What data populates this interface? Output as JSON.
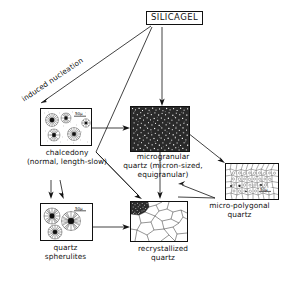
{
  "diagram": {
    "title_node": {
      "label": "SILICAGEL",
      "name": "silicagel-box"
    },
    "edge_labels": [
      {
        "label": "induced nucleation",
        "name": "induced-nucleation-label"
      }
    ],
    "nodes": [
      {
        "id": "chalcedony",
        "caption_lines": [
          "chalcedony",
          "(normal, length-slow)"
        ],
        "scale": "50µ",
        "texture": "spherulitic-fibrous"
      },
      {
        "id": "microgranular-quartz",
        "caption_lines": [
          "microgranular",
          "quartz (micron-sized,",
          "equigranular)"
        ],
        "scale": "",
        "texture": "dense-speckle"
      },
      {
        "id": "micro-polygonal-quartz",
        "caption_lines": [
          "micro-polygonal",
          "quartz"
        ],
        "scale": "50µ",
        "texture": "fine-polygonal-mosaic"
      },
      {
        "id": "quartz-spherulites",
        "caption_lines": [
          "quartz",
          "spherulites"
        ],
        "scale": "50µ",
        "texture": "radial-spherulites"
      },
      {
        "id": "recrystallized-quartz",
        "caption_lines": [
          "recrystallized",
          "quartz"
        ],
        "scale": "",
        "texture": "coarse-polygonal-mosaic"
      }
    ],
    "edges": [
      {
        "from": "SILICAGEL",
        "to": "chalcedony",
        "label": "induced nucleation"
      },
      {
        "from": "SILICAGEL",
        "to": "microgranular quartz",
        "label": ""
      },
      {
        "from": "SILICAGEL",
        "to": "recrystallized quartz",
        "label": ""
      },
      {
        "from": "chalcedony",
        "to": "microgranular quartz",
        "label": ""
      },
      {
        "from": "chalcedony",
        "to": "quartz spherulites",
        "label": ""
      },
      {
        "from": "chalcedony",
        "to": "recrystallized quartz",
        "label": ""
      },
      {
        "from": "microgranular quartz",
        "to": "micro-polygonal quartz",
        "label": ""
      },
      {
        "from": "microgranular quartz",
        "to": "recrystallized quartz",
        "label": ""
      },
      {
        "from": "micro-polygonal quartz",
        "to": "recrystallized quartz",
        "label": ""
      },
      {
        "from": "quartz spherulites",
        "to": "recrystallized quartz",
        "label": ""
      }
    ],
    "colors": {
      "ink": "#111111",
      "paper": "#ffffff"
    }
  }
}
